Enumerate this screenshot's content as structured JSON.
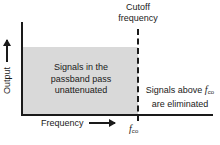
{
  "figure": {
    "colors": {
      "axis": "#1a1a1a",
      "passband_fill": "#d9d9d9",
      "background": "#ffffff",
      "text": "#1a1a1a"
    }
  },
  "axes": {
    "y_label": "Output",
    "x_label": "Frequency",
    "y_arrow_icon": "arrow-up-icon",
    "x_arrow_icon": "arrow-right-icon"
  },
  "cutoff": {
    "caption_line1": "Cutoff",
    "caption_line2": "frequency",
    "tick_symbol": "f",
    "tick_subscript": "co",
    "line_style": "dashed"
  },
  "annotations": {
    "passband": {
      "line1": "Signals in the",
      "line2": "passband pass",
      "line3": "unattenuated"
    },
    "stopband": {
      "line1_prefix": "Signals above ",
      "line1_symbol": "f",
      "line1_subscript": "co",
      "line2": "are eliminated"
    }
  },
  "chart_data": {
    "type": "area",
    "xlabel": "Frequency",
    "ylabel": "Output",
    "grid": false,
    "legend": "none",
    "series": [
      {
        "name": "Ideal low-pass response",
        "x": [
          0,
          1,
          1,
          1.65
        ],
        "y": [
          1,
          1,
          0,
          0
        ],
        "fill": true
      }
    ],
    "markers": [
      {
        "label": "f_co",
        "x": 1,
        "type": "vertical-dashed-line"
      }
    ],
    "xlim": [
      0,
      1.65
    ],
    "ylim": [
      0,
      1.35
    ],
    "xticks": [
      "f_co"
    ],
    "yticks": []
  }
}
